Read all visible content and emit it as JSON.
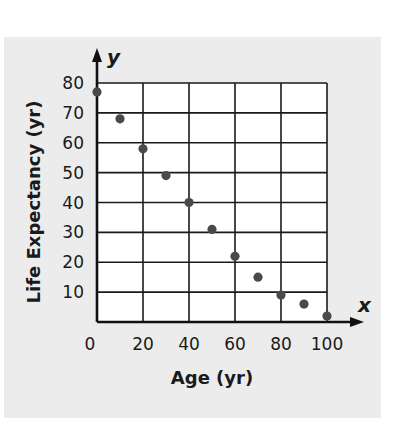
{
  "chart_data": {
    "type": "scatter",
    "title": "",
    "xlabel": "Age (yr)",
    "ylabel": "Life Expectancy (yr)",
    "x_axis_var": "x",
    "y_axis_var": "y",
    "xlim": [
      0,
      100
    ],
    "ylim": [
      0,
      80
    ],
    "x_ticks": [
      0,
      20,
      40,
      60,
      80,
      100
    ],
    "y_ticks": [
      10,
      20,
      30,
      40,
      50,
      60,
      70,
      80
    ],
    "x_grid_step": 20,
    "y_grid_step": 10,
    "grid": true,
    "legend": "none",
    "points": [
      {
        "x": 0,
        "y": 77
      },
      {
        "x": 10,
        "y": 68
      },
      {
        "x": 20,
        "y": 58
      },
      {
        "x": 30,
        "y": 49
      },
      {
        "x": 40,
        "y": 40
      },
      {
        "x": 50,
        "y": 31
      },
      {
        "x": 60,
        "y": 22
      },
      {
        "x": 70,
        "y": 15
      },
      {
        "x": 80,
        "y": 9
      },
      {
        "x": 90,
        "y": 6
      },
      {
        "x": 100,
        "y": 2
      }
    ],
    "colors": {
      "panel": "#ececec",
      "plot_bg": "#ffffff",
      "grid": "#1a1a1a",
      "point": "#4a4a4a"
    }
  }
}
